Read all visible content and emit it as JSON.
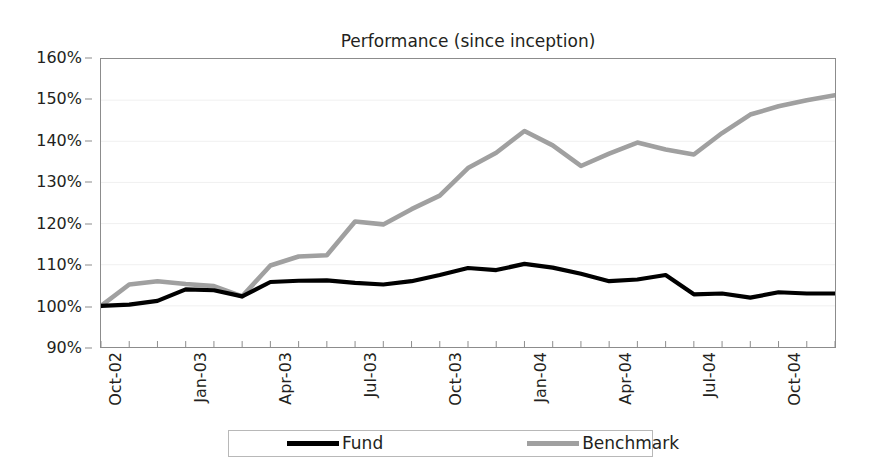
{
  "chart_data": {
    "type": "line",
    "title": "Performance (since inception)",
    "xlabel": "",
    "ylabel": "",
    "ylim": [
      90,
      160
    ],
    "ytick_values": [
      90,
      100,
      110,
      120,
      130,
      140,
      150,
      160
    ],
    "ytick_labels": [
      "90%",
      "100%",
      "110%",
      "120%",
      "130%",
      "140%",
      "150%",
      "160%"
    ],
    "grid": true,
    "legend_position": "bottom",
    "x": [
      "Oct-02",
      "Nov-02",
      "Dec-02",
      "Jan-03",
      "Feb-03",
      "Mar-03",
      "Apr-03",
      "May-03",
      "Jun-03",
      "Jul-03",
      "Aug-03",
      "Sep-03",
      "Oct-03",
      "Nov-03",
      "Dec-03",
      "Jan-04",
      "Feb-04",
      "Mar-04",
      "Apr-04",
      "May-04",
      "Jun-04",
      "Jul-04",
      "Aug-04",
      "Sep-04",
      "Oct-04",
      "Nov-04",
      "Dec-04"
    ],
    "xtick_labels": [
      "Oct-02",
      "Jan-03",
      "Apr-03",
      "Jul-03",
      "Oct-03",
      "Jan-04",
      "Apr-04",
      "Jul-04",
      "Oct-04"
    ],
    "xtick_indices": [
      0,
      3,
      6,
      9,
      12,
      15,
      18,
      21,
      24
    ],
    "series": [
      {
        "name": "Fund",
        "color": "#000000",
        "values": [
          100.0,
          100.3,
          101.2,
          104.0,
          103.8,
          102.3,
          105.8,
          106.1,
          106.2,
          105.6,
          105.2,
          106.0,
          107.5,
          109.2,
          108.7,
          110.2,
          109.3,
          107.8,
          106.0,
          106.4,
          107.5,
          102.8,
          103.0,
          102.0,
          103.3,
          103.0,
          103.0
        ]
      },
      {
        "name": "Benchmark",
        "color": "#a0a0a0",
        "values": [
          100.0,
          105.2,
          106.0,
          105.3,
          104.8,
          102.3,
          109.8,
          112.0,
          112.3,
          120.5,
          119.8,
          123.5,
          126.8,
          133.5,
          137.2,
          142.5,
          139.0,
          134.0,
          137.0,
          139.7,
          138.0,
          136.8,
          142.0,
          146.5,
          148.5,
          150.0,
          151.2
        ]
      }
    ]
  },
  "legend": {
    "fund_label": "Fund",
    "benchmark_label": "Benchmark"
  },
  "colors": {
    "fund": "#000000",
    "benchmark": "#a0a0a0",
    "axis": "#8c8c8c",
    "grid": "#f0f0f0",
    "text": "#231f20"
  }
}
